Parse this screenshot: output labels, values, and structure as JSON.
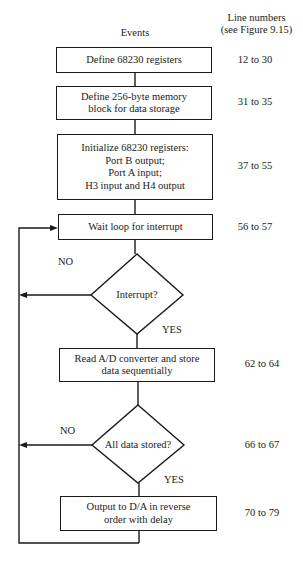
{
  "header": {
    "events_label": "Events",
    "line_numbers_label_1": "Line numbers",
    "line_numbers_label_2": "(see Figure 9.15)"
  },
  "steps": [
    {
      "type": "process",
      "lines": [
        "Define 68230 registers"
      ],
      "line_numbers": "12 to 30"
    },
    {
      "type": "process",
      "lines": [
        "Define 256-byte memory",
        "block for data storage"
      ],
      "line_numbers": "31 to 35"
    },
    {
      "type": "process",
      "lines": [
        "Initialize 68230 registers:",
        "Port B output;",
        "Port A input;",
        "H3 input and H4 output"
      ],
      "line_numbers": "37 to 55"
    },
    {
      "type": "process",
      "lines": [
        "Wait loop for interrupt"
      ],
      "line_numbers": "56 to 57"
    },
    {
      "type": "decision",
      "lines": [
        "Interrupt?"
      ],
      "no_label": "NO",
      "yes_label": "YES",
      "line_numbers": ""
    },
    {
      "type": "process",
      "lines": [
        "Read A/D converter and store",
        "data sequentially"
      ],
      "line_numbers": "62 to 64"
    },
    {
      "type": "decision",
      "lines": [
        "All data stored?"
      ],
      "no_label": "NO",
      "yes_label": "YES",
      "line_numbers": "66 to 67"
    },
    {
      "type": "process",
      "lines": [
        "Output to D/A in reverse",
        "order with delay"
      ],
      "line_numbers": "70 to 79"
    }
  ]
}
